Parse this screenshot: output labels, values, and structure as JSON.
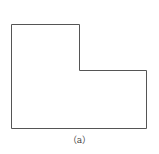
{
  "figure": {
    "caption": "（a）",
    "shape": "L-shaped polygon",
    "stroke_color": "#555555",
    "fill_color": "#ffffff",
    "points": "11.5,24.5 79.5,24.5 79.5,70.5 146.5,70.5 146.5,128.5 11.5,128.5"
  }
}
